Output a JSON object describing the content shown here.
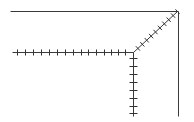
{
  "diagram": {
    "title": "",
    "colors": {
      "stroke": "#333333",
      "background": "#ffffff"
    },
    "origin": {
      "x": 133,
      "y": 52
    },
    "frame": {
      "top": {
        "x1": 10,
        "y1": 11,
        "x2": 178,
        "y2": 11
      },
      "right": {
        "x1": 178,
        "y1": 11,
        "x2": 178,
        "y2": 116
      }
    },
    "axes": [
      {
        "name": "left-horizontal-axis",
        "x1": 12,
        "y1": 52,
        "x2": 133,
        "y2": 52,
        "ticks": [
          17,
          25,
          33,
          41,
          49,
          57,
          65,
          73,
          81,
          88,
          96,
          104,
          111,
          118,
          125
        ],
        "tick_orientation": "vertical",
        "tick_half": 3
      },
      {
        "name": "down-vertical-axis",
        "x1": 133,
        "y1": 52,
        "x2": 133,
        "y2": 116,
        "ticks": [
          58,
          66,
          74,
          82,
          90,
          98,
          106,
          113
        ],
        "tick_orientation": "horizontal",
        "tick_half": 4
      },
      {
        "name": "diagonal-axis",
        "x1": 133,
        "y1": 52,
        "x2": 177,
        "y2": 11,
        "ticks_t": [
          0.1,
          0.2,
          0.3,
          0.4,
          0.5,
          0.6,
          0.7,
          0.8,
          0.9,
          1.0
        ],
        "tick_orientation": "perpendicular",
        "tick_half": 3
      }
    ]
  }
}
